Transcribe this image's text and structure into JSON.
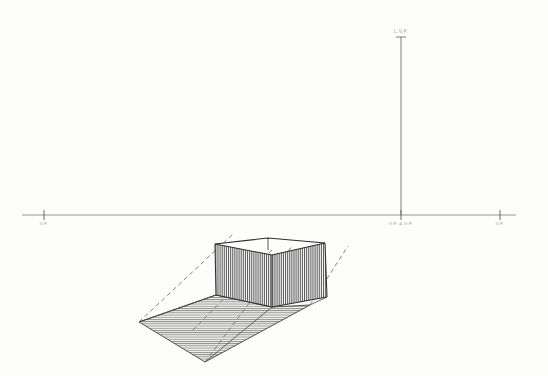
{
  "drawing": {
    "title": "Two-Point Perspective Shadow Construction",
    "medium": "pencil-on-paper",
    "paper_color": "#fdfdfc",
    "ink_color": "#3a3a3a",
    "construction_color": "#9a9a9a"
  },
  "horizon": {
    "label": "horizon-line",
    "y": 215,
    "x_start": 22,
    "x_end": 516,
    "color": "#8a8a8a"
  },
  "vertical_axis": {
    "label": "light-source-vertical",
    "x": 401,
    "y_top": 37,
    "y_bottom": 215,
    "color": "#6f6f6f"
  },
  "labels": {
    "left_vp": "V.P.",
    "right_vp": "V.P.",
    "center_vp": "V.P. & V.P.",
    "top_vp": "L.V.P."
  },
  "tick_marks": [
    {
      "name": "tick-left-vp",
      "x": 44,
      "y": 215
    },
    {
      "name": "tick-center-vp",
      "x": 401,
      "y": 215
    },
    {
      "name": "tick-right-vp",
      "x": 500,
      "y": 215
    }
  ],
  "box": {
    "name": "rectangular-prism",
    "top_left": [
      215,
      244
    ],
    "top_back": [
      268,
      238
    ],
    "top_right": [
      325,
      243
    ],
    "top_front": [
      272,
      255
    ],
    "bottom_left": [
      216,
      295
    ],
    "bottom_front": [
      272,
      307
    ],
    "bottom_right": [
      327,
      297
    ],
    "hatch": "vertical",
    "hatch_spacing": 2.0
  },
  "shadow": {
    "name": "cast-shadow-plane",
    "points": [
      [
        139,
        322
      ],
      [
        205,
        362
      ],
      [
        310,
        305
      ],
      [
        272,
        307
      ],
      [
        216,
        295
      ]
    ],
    "hatch": "horizontal",
    "hatch_spacing": 2.2,
    "fill": "#e8e8e6"
  },
  "light_rays": [
    {
      "name": "ray-top-left",
      "from": [
        139,
        322
      ],
      "to": [
        232,
        235
      ]
    },
    {
      "name": "ray-through-front",
      "from": [
        205,
        362
      ],
      "to": [
        288,
        248
      ]
    },
    {
      "name": "ray-right",
      "from": [
        310,
        305
      ],
      "to": [
        345,
        248
      ]
    },
    {
      "name": "ray-inner",
      "from": [
        196,
        327
      ],
      "to": [
        268,
        252
      ]
    }
  ]
}
